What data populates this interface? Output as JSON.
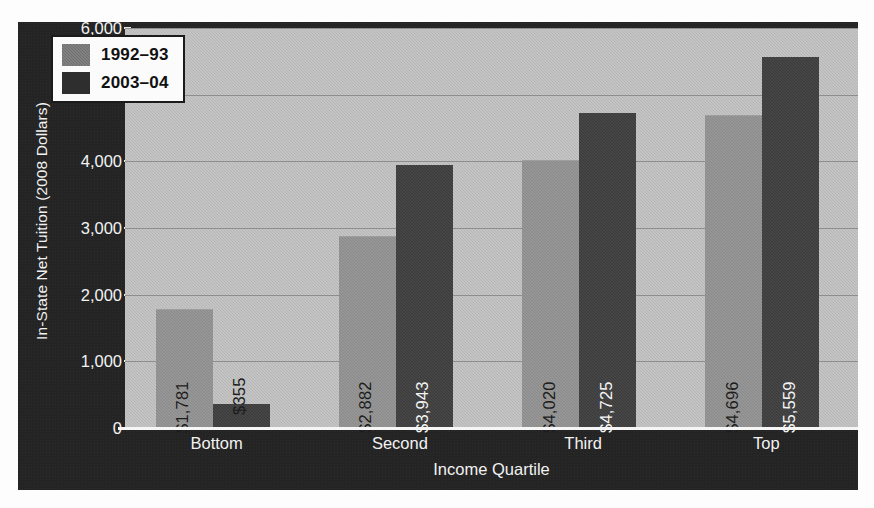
{
  "chart_data": {
    "type": "bar",
    "title": "",
    "xlabel": "Income Quartile",
    "ylabel": "In-State Net Tuition (2008 Dollars)",
    "categories": [
      "Bottom",
      "Second",
      "Third",
      "Top"
    ],
    "series": [
      {
        "name": "1992–93",
        "values": [
          1781,
          2882,
          4020,
          4696
        ],
        "labels": [
          "$1,781",
          "$2,882",
          "$4,020",
          "$4,696"
        ],
        "color": "#8a8a8a",
        "label_color": "#1d1d1d"
      },
      {
        "name": "2003–04",
        "values": [
          355,
          3943,
          4725,
          5559
        ],
        "labels": [
          "$355",
          "$3,943",
          "$4,725",
          "$5,559"
        ],
        "color": "#3a3a3a",
        "label_color": "#f4f4f4"
      }
    ],
    "ylim": [
      0,
      6000
    ],
    "yticks": [
      0,
      1000,
      2000,
      3000,
      4000,
      5000,
      6000
    ],
    "ytick_labels": [
      "0",
      "1,000",
      "2,000",
      "3,000",
      "4,000",
      "5,000",
      "6,000"
    ],
    "grid": true,
    "legend_position": "top-left",
    "plot_background": "#bcbcbc",
    "panel_background": "#242424",
    "axis_text_color": "#f2f2f2"
  },
  "legend": {
    "entries": [
      {
        "label": "1992–93",
        "swatch": "legend-swatch-old"
      },
      {
        "label": "2003–04",
        "swatch": "legend-swatch-new"
      }
    ]
  }
}
